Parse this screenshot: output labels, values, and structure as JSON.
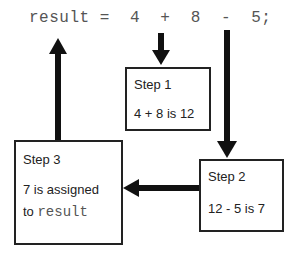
{
  "code_line": "result =  4  +  8  -  5;",
  "steps": [
    {
      "title": "Step 1",
      "line1": "4 + 8 is 12"
    },
    {
      "title": "Step 2",
      "line1": "12 - 5 is 7"
    },
    {
      "title": "Step 3",
      "line1": "7 is assigned",
      "line2_prefix": "to ",
      "line2_code": "result"
    }
  ],
  "colors": {
    "arrow": "#111111",
    "border": "#222222",
    "code_text": "#555555"
  }
}
